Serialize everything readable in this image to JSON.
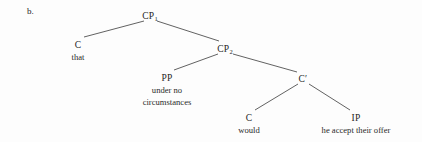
{
  "figure": {
    "example_marker": "b.",
    "ink_color": "#2a2a2a",
    "background_color": "#fdfdfd"
  },
  "tree": {
    "root": {
      "id": "cp1",
      "label": "CP",
      "subscript": "1",
      "terminal": "",
      "x": 150,
      "y": 11
    },
    "nodes": [
      {
        "id": "c-that",
        "label": "C",
        "subscript": "",
        "terminal": "that",
        "x": 78,
        "y": 40
      },
      {
        "id": "cp2",
        "label": "CP",
        "subscript": "2",
        "terminal": "",
        "x": 225,
        "y": 44
      },
      {
        "id": "pp",
        "label": "PP",
        "subscript": "",
        "terminal_line1": "under no",
        "terminal_line2": "circumstances",
        "x": 167,
        "y": 73
      },
      {
        "id": "cbar",
        "label": "C′",
        "subscript": "",
        "terminal": "",
        "x": 303,
        "y": 74
      },
      {
        "id": "c-would",
        "label": "C",
        "subscript": "",
        "terminal": "would",
        "x": 249,
        "y": 113
      },
      {
        "id": "ip",
        "label": "IP",
        "subscript": "",
        "terminal": "he accept their offer",
        "x": 356,
        "y": 113
      }
    ],
    "edges": [
      {
        "from": "cp1",
        "to": "c-that",
        "x1": 144,
        "y1": 21,
        "x2": 84,
        "y2": 37
      },
      {
        "from": "cp1",
        "to": "cp2",
        "x1": 157,
        "y1": 21,
        "x2": 219,
        "y2": 41
      },
      {
        "from": "cp2",
        "to": "pp",
        "x1": 218,
        "y1": 54,
        "x2": 174,
        "y2": 70
      },
      {
        "from": "cp2",
        "to": "cbar",
        "x1": 233,
        "y1": 54,
        "x2": 297,
        "y2": 72
      },
      {
        "from": "cbar",
        "to": "c-would",
        "x1": 298,
        "y1": 84,
        "x2": 255,
        "y2": 110
      },
      {
        "from": "cbar",
        "to": "ip",
        "x1": 309,
        "y1": 84,
        "x2": 350,
        "y2": 110
      }
    ]
  }
}
